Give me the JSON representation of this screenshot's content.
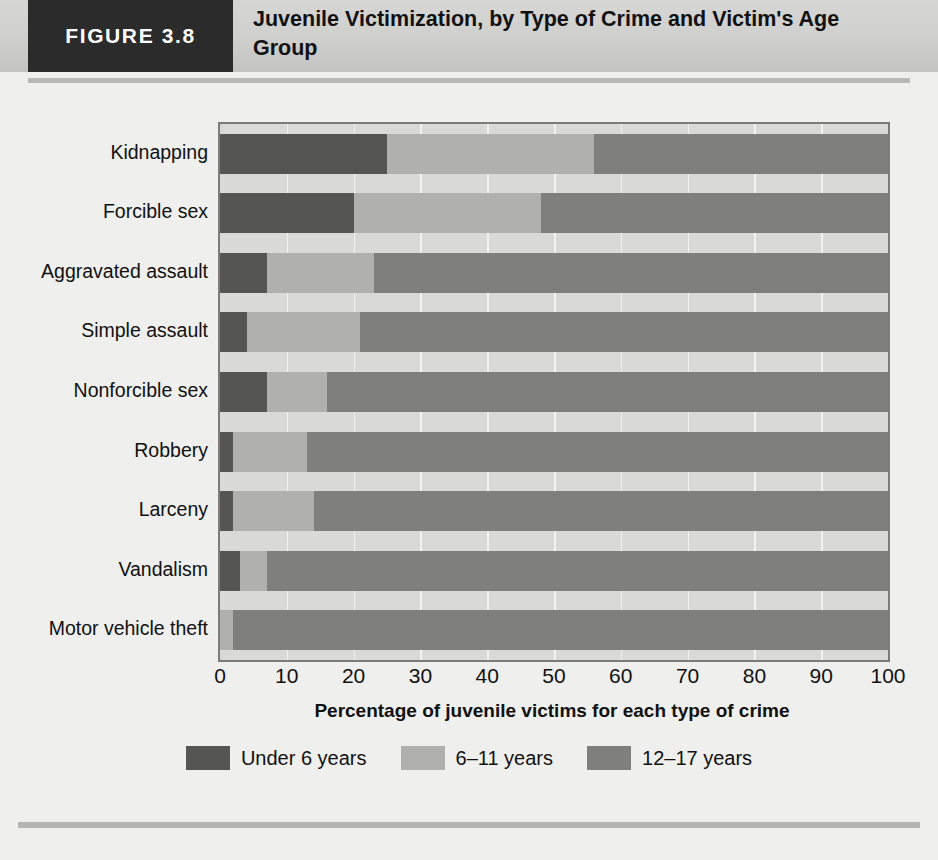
{
  "figure": {
    "tag": "FIGURE 3.8",
    "title": "Juvenile Victimization, by Type of Crime and Victim's Age Group"
  },
  "chart_data": {
    "type": "bar",
    "orientation": "horizontal",
    "stacked": true,
    "stack_mode": "percent",
    "title": "Juvenile Victimization, by Type of Crime and Victim's Age Group",
    "xlabel": "Percentage of juvenile victims for each type of crime",
    "ylabel": "",
    "xlim": [
      0,
      100
    ],
    "xticks": [
      0,
      10,
      20,
      30,
      40,
      50,
      60,
      70,
      80,
      90,
      100
    ],
    "grid": true,
    "legend_position": "bottom",
    "categories": [
      "Kidnapping",
      "Forcible sex",
      "Aggravated assault",
      "Simple assault",
      "Nonforcible sex",
      "Robbery",
      "Larceny",
      "Vandalism",
      "Motor vehicle theft"
    ],
    "series": [
      {
        "name": "Under 6 years",
        "color": "#555553",
        "values": [
          25,
          20,
          7,
          4,
          7,
          2,
          2,
          3,
          0
        ]
      },
      {
        "name": "6-11 years",
        "color": "#b0b0ae",
        "values": [
          31,
          28,
          16,
          17,
          9,
          11,
          12,
          4,
          2
        ]
      },
      {
        "name": "12-17 years",
        "color": "#7f7f7d",
        "values": [
          44,
          52,
          77,
          79,
          84,
          87,
          86,
          93,
          98
        ]
      }
    ],
    "legend": [
      "Under 6 years",
      "6–11 years",
      "12–17 years"
    ]
  },
  "axis": {
    "tick_labels": [
      "0",
      "10",
      "20",
      "30",
      "40",
      "50",
      "60",
      "70",
      "80",
      "90",
      "100"
    ],
    "x_title": "Percentage of juvenile victims for each type of crime"
  },
  "legend": {
    "items": [
      {
        "label": "Under 6 years",
        "color": "#555553"
      },
      {
        "label": "6–11 years",
        "color": "#b0b0ae"
      },
      {
        "label": "12–17 years",
        "color": "#7f7f7d"
      }
    ]
  }
}
